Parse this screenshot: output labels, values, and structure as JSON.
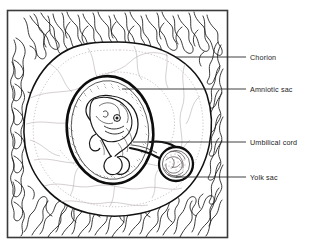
{
  "figure": {
    "type": "anatomical-diagram",
    "frame": {
      "x": 7,
      "y": 10,
      "width": 221,
      "height": 228,
      "border_color": "#3a3a3a"
    },
    "style": {
      "line_color": "#1a1a1a",
      "faint_line_color": "#b9aeb2",
      "leader_color": "#2b2b2b",
      "background": "#ffffff",
      "stipple_color": "#5a5055"
    }
  },
  "labels": [
    {
      "id": "chorion",
      "text": "Chorion",
      "leader": {
        "x1": 175,
        "y1": 57,
        "x2": 246,
        "y2": 57
      },
      "text_x": 250,
      "text_y": 54
    },
    {
      "id": "amniotic_sac",
      "text": "Amniotic sac",
      "leader": {
        "x1": 122,
        "y1": 89,
        "x2": 246,
        "y2": 89
      },
      "text_x": 250,
      "text_y": 86
    },
    {
      "id": "umbilical_cord",
      "text": "Umbilical cord",
      "leader": {
        "x1": 133,
        "y1": 142,
        "x2": 246,
        "y2": 142
      },
      "text_x": 250,
      "text_y": 139
    },
    {
      "id": "yolk_sac",
      "text": "Yolk sac",
      "leader": {
        "x1": 176,
        "y1": 177,
        "x2": 246,
        "y2": 177
      },
      "text_x": 250,
      "text_y": 174
    }
  ],
  "structures": {
    "chorionic_villi": "branching frond-like projections lining the inside of the frame",
    "chorion_wall": "large oval outline enclosing the chorionic cavity",
    "amniotic_sac": "thick dark oval surrounding the embryo",
    "embryo": "curled C-shaped embryo with head, eye, limb buds and tail",
    "umbilical_cord": "narrow stalk connecting embryo to yolk sac",
    "yolk_sac": "small round stippled sphere at lower right of embryo"
  }
}
